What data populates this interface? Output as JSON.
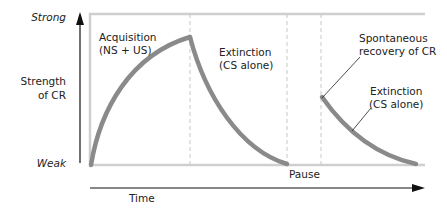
{
  "diagram": {
    "y_axis": {
      "top_label": "Strong",
      "title_line1": "Strength",
      "title_line2": "of CR",
      "bottom_label": "Weak"
    },
    "x_axis": {
      "label": "Time"
    },
    "phases": [
      {
        "line1": "Acquisition",
        "line2": "(NS + US)"
      },
      {
        "line1": "Extinction",
        "line2": "(CS alone)"
      },
      {
        "line1": "Pause"
      },
      {
        "line1": "Spontaneous",
        "line2": "recovery of CR"
      },
      {
        "line1": "Extinction",
        "line2": "(CS alone)"
      }
    ],
    "colors": {
      "curve": "#8a8a8a",
      "frame": "#cfcfcf",
      "dashed": "#c8c8c8",
      "axis": "#111111"
    }
  }
}
